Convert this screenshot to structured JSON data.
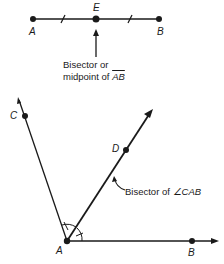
{
  "segment": {
    "points": [
      {
        "label": "A",
        "x": 33,
        "y": 19
      },
      {
        "label": "E",
        "x": 96,
        "y": 19
      },
      {
        "label": "B",
        "x": 159,
        "y": 19
      }
    ],
    "annotation": {
      "line1": "Bisector or",
      "line2_prefix": "midpoint of ",
      "line2_segment": "AB"
    }
  },
  "angle": {
    "vertex": {
      "label": "A"
    },
    "ray_points": [
      {
        "label": "C"
      },
      {
        "label": "D"
      },
      {
        "label": "B"
      }
    ],
    "annotation": {
      "prefix": "Bisector of ",
      "angle_symbol": "∠",
      "angle_name": "CAB"
    }
  },
  "colors": {
    "ink": "#1a1a1a",
    "background": "#ffffff"
  }
}
